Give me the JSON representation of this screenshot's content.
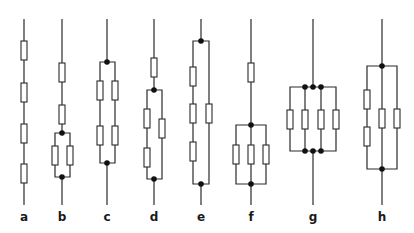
{
  "figure": {
    "type": "resistor-network-diagrams",
    "panels": [
      {
        "label": "a",
        "x": 24,
        "description": "4 resistors in series"
      },
      {
        "label": "b",
        "x": 62,
        "description": "2 series resistors then 2 in parallel"
      },
      {
        "label": "c",
        "x": 107,
        "description": "2 parallel branches, each 2 series resistors"
      },
      {
        "label": "d",
        "x": 154,
        "description": "1 resistor then parallel: 2 series vs 1"
      },
      {
        "label": "e",
        "x": 201,
        "description": "parallel: 3 series vs 1"
      },
      {
        "label": "f",
        "x": 251,
        "description": "1 resistor then 3 in parallel"
      },
      {
        "label": "g",
        "x": 313,
        "description": "4 resistors in parallel"
      },
      {
        "label": "h",
        "x": 382,
        "description": "parallel: 2 series vs 1 vs 1"
      }
    ]
  },
  "colors": {
    "line": "#2a2a2a",
    "node": "#111111",
    "background": "#ffffff"
  }
}
